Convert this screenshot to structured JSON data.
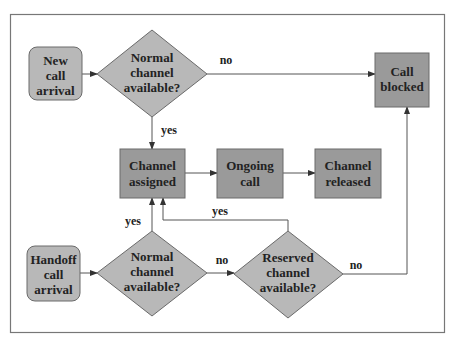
{
  "diagram": {
    "colors": {
      "rect_fill": "#9a9a9a",
      "light_fill": "#b8b8b8",
      "stroke": "#6a6a6a",
      "line": "#555555",
      "frame": "#777777"
    },
    "nodes": {
      "new_call": {
        "line1": "New",
        "line2": "call",
        "line3": "arrival"
      },
      "normal_top": {
        "line1": "Normal",
        "line2": "channel",
        "line3": "available?"
      },
      "call_blocked": {
        "line1": "Call",
        "line2": "blocked"
      },
      "channel_assigned": {
        "line1": "Channel",
        "line2": "assigned"
      },
      "ongoing_call": {
        "line1": "Ongoing",
        "line2": "call"
      },
      "channel_released": {
        "line1": "Channel",
        "line2": "released"
      },
      "handoff_call": {
        "line1": "Handoff",
        "line2": "call",
        "line3": "arrival"
      },
      "normal_bottom": {
        "line1": "Normal",
        "line2": "channel",
        "line3": "available?"
      },
      "reserved": {
        "line1": "Reserved",
        "line2": "channel",
        "line3": "available?"
      }
    },
    "edges": {
      "top_no": "no",
      "top_yes": "yes",
      "bottom_yes": "yes",
      "reserved_yes": "yes",
      "bottom_no": "no",
      "reserved_no": "no"
    }
  }
}
